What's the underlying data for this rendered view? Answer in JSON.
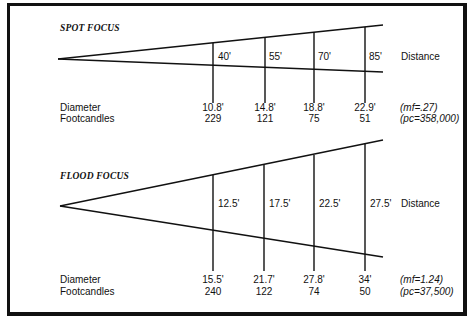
{
  "spot": {
    "title": "SPOT FOCUS",
    "distance_label": "Distance",
    "row_labels": {
      "diameter": "Diameter",
      "footcandles": "Footcandles"
    },
    "distances": [
      "40'",
      "55'",
      "70'",
      "85'"
    ],
    "diameters": [
      "10.8'",
      "14.8'",
      "18.8'",
      "22.9'"
    ],
    "footcandles": [
      "229",
      "121",
      "75",
      "51"
    ],
    "mf": "(mf=.27)",
    "pc": "(pc=358,000)"
  },
  "flood": {
    "title": "FLOOD FOCUS",
    "distance_label": "Distance",
    "row_labels": {
      "diameter": "Diameter",
      "footcandles": "Footcandles"
    },
    "distances": [
      "12.5'",
      "17.5'",
      "22.5'",
      "27.5'"
    ],
    "diameters": [
      "15.5'",
      "21.7'",
      "27.8'",
      "34'"
    ],
    "footcandles": [
      "240",
      "122",
      "74",
      "50"
    ],
    "mf": "(mf=1.24)",
    "pc": "(pc=37,500)"
  }
}
